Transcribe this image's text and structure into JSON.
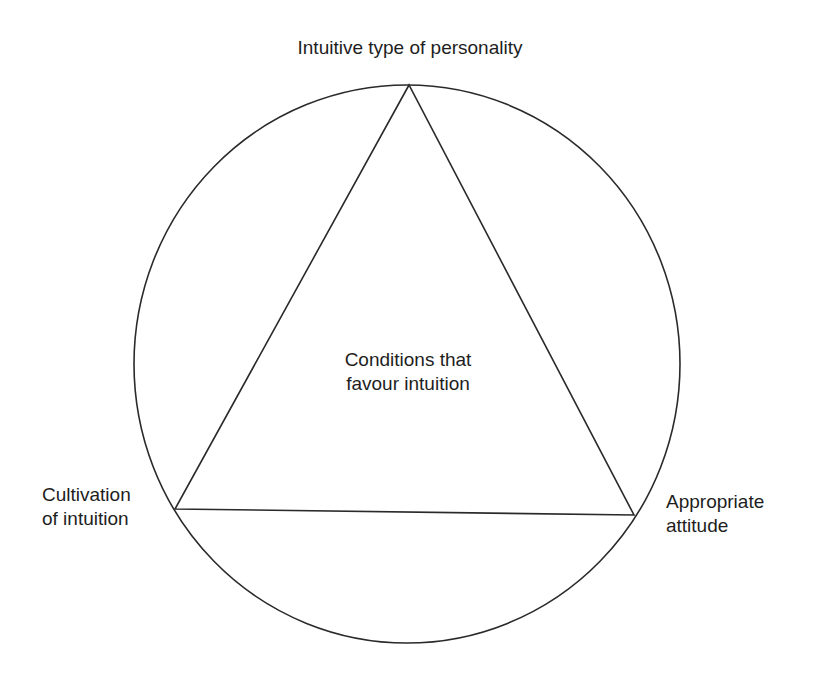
{
  "diagram": {
    "type": "circle-inscribed-triangle",
    "colors": {
      "stroke": "#2a2a2a",
      "text": "#1e1e1e",
      "background": "#ffffff"
    },
    "center": {
      "line1": "Conditions that",
      "line2": "favour intuition"
    },
    "vertices": {
      "top": {
        "line1": "Intuitive type of personality"
      },
      "left": {
        "line1": "Cultivation",
        "line2": "of intuition"
      },
      "right": {
        "line1": "Appropriate",
        "line2": "attitude"
      }
    }
  }
}
